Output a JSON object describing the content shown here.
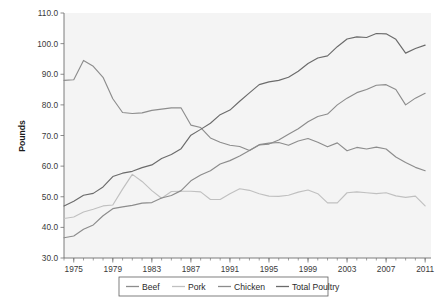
{
  "chart_data": {
    "type": "line",
    "title": "",
    "xlabel": "",
    "ylabel": "Pounds",
    "xlim": [
      1974,
      2011.6
    ],
    "ylim": [
      30.0,
      110.0
    ],
    "grid": false,
    "legend_position": "bottom",
    "x_tick_labels": [
      "1975",
      "1979",
      "1983",
      "1987",
      "1991",
      "1995",
      "1999",
      "2003",
      "2007",
      "2011"
    ],
    "x_tick_values": [
      1975,
      1979,
      1983,
      1987,
      1991,
      1995,
      1999,
      2003,
      2007,
      2011
    ],
    "x_minor_tick_step": 1,
    "y_tick_labels": [
      "30.0",
      "40.0",
      "50.0",
      "60.0",
      "70.0",
      "80.0",
      "90.0",
      "100.0",
      "110.0"
    ],
    "y_tick_values": [
      30.0,
      40.0,
      50.0,
      60.0,
      70.0,
      80.0,
      90.0,
      100.0,
      110.0
    ],
    "x": [
      1974,
      1975,
      1976,
      1977,
      1978,
      1979,
      1980,
      1981,
      1982,
      1983,
      1984,
      1985,
      1986,
      1987,
      1988,
      1989,
      1990,
      1991,
      1992,
      1993,
      1994,
      1995,
      1996,
      1997,
      1998,
      1999,
      2000,
      2001,
      2002,
      2003,
      2004,
      2005,
      2006,
      2007,
      2008,
      2009,
      2010,
      2011
    ],
    "series": [
      {
        "name": "Beef",
        "color": "#8d8d8d",
        "values": [
          88.0,
          88.2,
          94.5,
          92.6,
          89.0,
          82.0,
          77.5,
          77.2,
          77.4,
          78.2,
          78.6,
          79.0,
          79.0,
          73.4,
          72.6,
          69.2,
          67.8,
          66.8,
          66.4,
          65.1,
          67.0,
          67.5,
          67.7,
          66.8,
          68.2,
          69.0,
          67.8,
          66.3,
          67.6,
          65.0,
          66.1,
          65.6,
          66.2,
          65.6,
          63.0,
          61.2,
          59.6,
          58.5
        ],
        "label_end_value": 58.5
      },
      {
        "name": "Pork",
        "color": "#c0c0c0",
        "values": [
          42.9,
          43.4,
          45.0,
          45.9,
          47.0,
          47.3,
          52.5,
          57.3,
          55.0,
          52.0,
          49.5,
          51.7,
          51.8,
          51.8,
          51.6,
          49.1,
          49.1,
          51.0,
          52.6,
          52.1,
          51.0,
          50.2,
          50.1,
          50.5,
          51.5,
          52.2,
          51.0,
          48.0,
          48.0,
          51.3,
          51.6,
          51.3,
          51.0,
          51.3,
          50.3,
          49.8,
          50.2,
          47.0
        ]
      },
      {
        "name": "Chicken",
        "color": "#8c8c8c",
        "values": [
          36.6,
          37.2,
          39.4,
          40.8,
          43.8,
          46.1,
          46.7,
          47.2,
          47.9,
          48.1,
          49.6,
          50.4,
          52.0,
          55.2,
          57.1,
          58.5,
          60.7,
          61.8,
          63.3,
          65.1,
          66.9,
          67.2,
          68.5,
          70.4,
          72.2,
          74.5,
          76.2,
          77.0,
          80.0,
          82.2,
          84.0,
          85.0,
          86.4,
          86.6,
          85.0,
          80.0,
          82.2,
          83.8
        ]
      },
      {
        "name": "Total Poultry",
        "color": "#6b6b6b",
        "values": [
          47.0,
          48.5,
          50.5,
          51.1,
          53.2,
          56.6,
          57.7,
          58.3,
          59.5,
          60.4,
          62.5,
          63.8,
          65.7,
          70.1,
          72.0,
          74.0,
          76.8,
          78.3,
          81.2,
          83.9,
          86.6,
          87.5,
          88.0,
          89.0,
          91.0,
          93.5,
          95.3,
          96.0,
          99.0,
          101.5,
          102.2,
          102.0,
          103.3,
          103.2,
          101.4,
          96.9,
          98.4,
          99.5
        ]
      }
    ]
  },
  "legend": {
    "items": [
      {
        "label": "Beef",
        "color": "#8d8d8d"
      },
      {
        "label": "Pork",
        "color": "#c0c0c0"
      },
      {
        "label": "Chicken",
        "color": "#8c8c8c"
      },
      {
        "label": "Total Poultry",
        "color": "#6b6b6b"
      }
    ]
  },
  "axes": {
    "y_title": "Pounds"
  },
  "colors": {
    "plot_background": "#f4f4f4",
    "page_background": "#ffffff",
    "axis": "#6e6e6e",
    "text": "#3a3a3a"
  }
}
